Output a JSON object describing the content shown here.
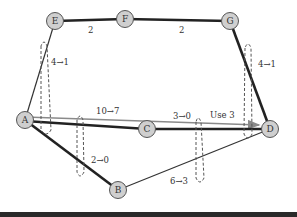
{
  "diagram": {
    "type": "flow-network-cuts",
    "nodes": [
      {
        "id": "E",
        "label": "E",
        "x": 55,
        "y": 21
      },
      {
        "id": "F",
        "label": "F",
        "x": 125,
        "y": 19
      },
      {
        "id": "G",
        "label": "G",
        "x": 230,
        "y": 21
      },
      {
        "id": "A",
        "label": "A",
        "x": 25,
        "y": 120
      },
      {
        "id": "C",
        "label": "C",
        "x": 147,
        "y": 129
      },
      {
        "id": "D",
        "label": "D",
        "x": 270,
        "y": 129
      },
      {
        "id": "B",
        "label": "B",
        "x": 118,
        "y": 190
      }
    ],
    "edges": [
      {
        "from": "E",
        "to": "F",
        "label": "2",
        "style": "thick"
      },
      {
        "from": "F",
        "to": "G",
        "label": "2",
        "style": "thick"
      },
      {
        "from": "A",
        "to": "E",
        "label": "4→1",
        "style": "thin"
      },
      {
        "from": "G",
        "to": "D",
        "label": "4→1",
        "style": "thick"
      },
      {
        "from": "A",
        "to": "D",
        "label": "10→7",
        "style": "gray-arrow"
      },
      {
        "from": "A",
        "to": "C",
        "label": "",
        "style": "thick"
      },
      {
        "from": "C",
        "to": "D",
        "label": "3→0",
        "style": "thick"
      },
      {
        "from": "A",
        "to": "B",
        "label": "2→0",
        "style": "thick"
      },
      {
        "from": "B",
        "to": "D",
        "label": "6→3",
        "style": "thin"
      }
    ],
    "annotations": {
      "use": "Use 3"
    },
    "labels": {
      "ef": "2",
      "fg": "2",
      "ae": "4→1",
      "gd": "4→1",
      "ad": "10→7",
      "cd": "3→0",
      "use": "Use 3",
      "ab": "2→0",
      "bd": "6→3"
    },
    "colors": {
      "node_fill": "#cfcfcf",
      "node_stroke": "#555555",
      "edge_dark": "#222222",
      "edge_gray": "#8a8a8a",
      "bottom_bar": "#2a2a2a"
    }
  }
}
